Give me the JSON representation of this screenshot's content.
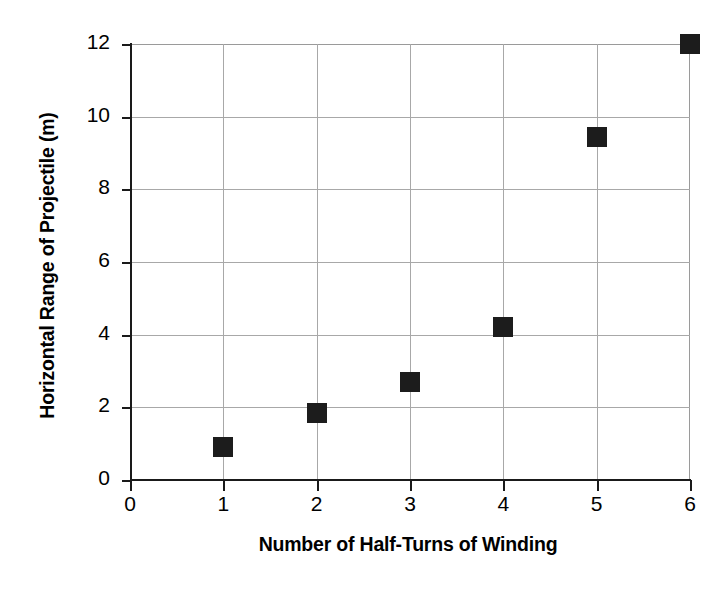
{
  "chart_data": {
    "type": "scatter",
    "title": "",
    "xlabel": "Number of Half-Turns of Winding",
    "ylabel": "Horizontal Range of Projectile (m)",
    "x": [
      1,
      2,
      3,
      4,
      5,
      6
    ],
    "values": [
      0.9,
      1.85,
      2.7,
      4.2,
      9.45,
      12.0
    ],
    "series": [
      {
        "name": "Horizontal Range",
        "x": [
          1,
          2,
          3,
          4,
          5,
          6
        ],
        "values": [
          0.9,
          1.85,
          2.7,
          4.2,
          9.45,
          12.0
        ]
      }
    ],
    "xlim": [
      0,
      6
    ],
    "ylim": [
      0,
      12
    ],
    "xticks": [
      "0",
      "1",
      "2",
      "3",
      "4",
      "5",
      "6"
    ],
    "yticks": [
      "0",
      "2",
      "4",
      "6",
      "8",
      "10",
      "12"
    ],
    "xtick_values": [
      0,
      1,
      2,
      3,
      4,
      5,
      6
    ],
    "ytick_values": [
      0,
      2,
      4,
      6,
      8,
      10,
      12
    ],
    "grid": true,
    "grid_color": "#a8a8a8",
    "marker": "square",
    "marker_color": "#1c1c1c",
    "legend": null,
    "legend_position": "none",
    "annotations": []
  },
  "axis": {
    "y_title": "Horizontal Range of Projectile (m)",
    "x_title": "Number of Half-Turns of Winding"
  }
}
